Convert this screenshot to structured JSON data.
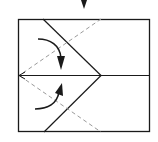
{
  "diagram": {
    "type": "origami-fold-step",
    "colors": {
      "line": "#1a1a1a",
      "dashed": "#9a9a9a",
      "background": "#ffffff"
    },
    "step_arrow": {
      "icon": "down-arrow-icon"
    },
    "paper": {
      "x": 18,
      "y": 19,
      "width": 132,
      "height": 113
    },
    "creases": {
      "midline": {
        "y": 75
      },
      "valley_folds": [
        "top-diagonal",
        "bottom-diagonal"
      ],
      "mountain_folds_dashed": [
        "top-dashed",
        "bottom-dashed"
      ]
    },
    "fold_arrows": [
      {
        "name": "fold-down-arrow",
        "direction": "down"
      },
      {
        "name": "fold-up-arrow",
        "direction": "up"
      }
    ]
  }
}
